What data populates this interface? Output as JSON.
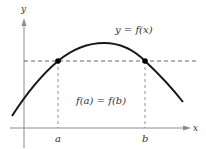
{
  "diagram": {
    "curve_label": "y = f(x)",
    "equality_label": "f(a) = f(b)",
    "axes": {
      "x_label": "x",
      "y_label": "y"
    },
    "points": [
      {
        "label": "a",
        "x": 58,
        "y": 61
      },
      {
        "label": "b",
        "x": 145,
        "y": 61
      }
    ],
    "colors": {
      "curve": "#1a1a1a",
      "axis": "#8c8c8c",
      "dashed": "#555555",
      "text": "#333333"
    }
  }
}
